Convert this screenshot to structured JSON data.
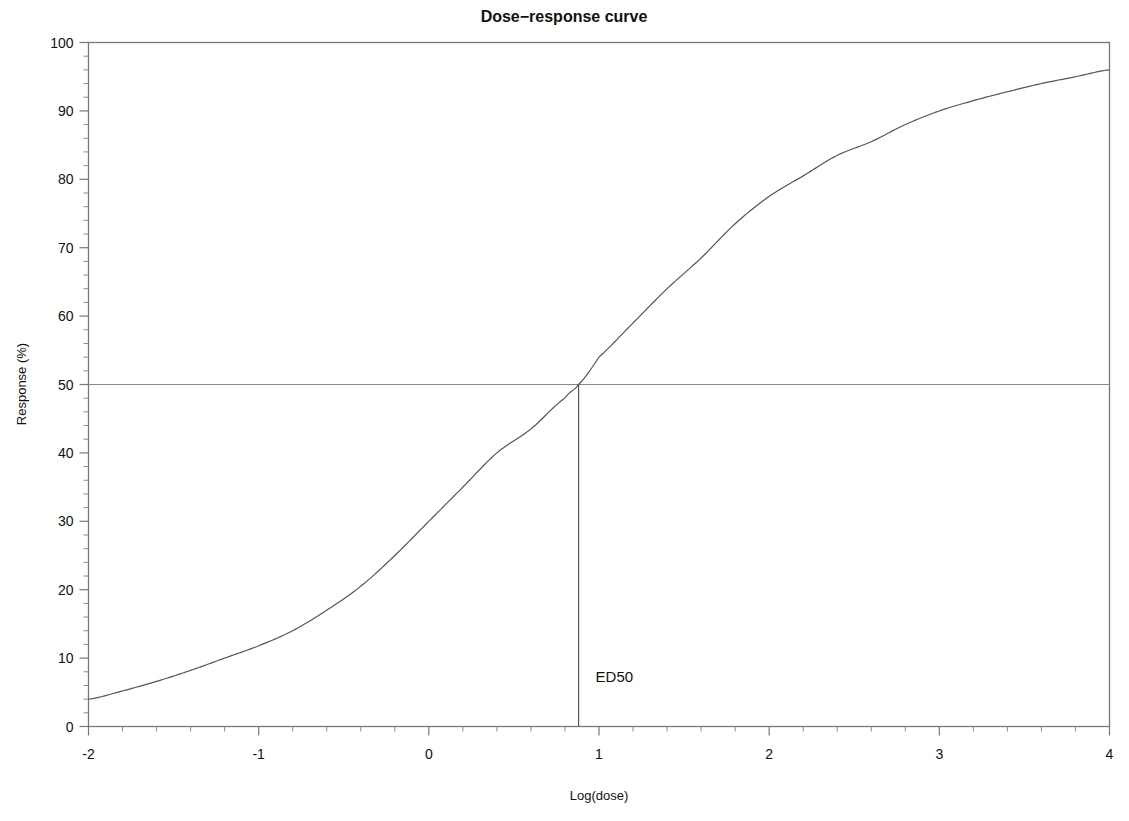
{
  "chart_data": {
    "type": "line",
    "title": "Dose−response curve",
    "xlabel": "Log(dose)",
    "ylabel": "Response (%)",
    "xlim": [
      -2,
      4
    ],
    "ylim": [
      0,
      100
    ],
    "grid": false,
    "legend": null,
    "xticks": [
      -2,
      -1,
      0,
      1,
      2,
      3,
      4
    ],
    "xticklabels": [
      "-2",
      "-1",
      "0",
      "1",
      "2",
      "3",
      "4"
    ],
    "x_minor_tick_count_per_interval": 5,
    "yticks": [
      0,
      10,
      20,
      30,
      40,
      50,
      60,
      70,
      80,
      90,
      100
    ],
    "yticklabels": [
      "0",
      "10",
      "20",
      "30",
      "40",
      "50",
      "60",
      "70",
      "80",
      "90",
      "100"
    ],
    "y_minor_tick_count_per_interval": 5,
    "series": [
      {
        "name": "dose-response",
        "color": "#555555",
        "linewidth": 1.2,
        "model": "logistic",
        "bottom": 2.0,
        "top": 100.0,
        "ed50_log": 0.88,
        "hill_slope": 0.78,
        "x": [
          -2.0,
          -1.8,
          -1.6,
          -1.4,
          -1.2,
          -1.0,
          -0.8,
          -0.6,
          -0.4,
          -0.2,
          0.0,
          0.2,
          0.4,
          0.6,
          0.8,
          0.88,
          1.0,
          1.2,
          1.4,
          1.6,
          1.8,
          2.0,
          2.2,
          2.4,
          2.6,
          2.8,
          3.0,
          3.2,
          3.4,
          3.6,
          3.8,
          4.0
        ],
        "y": [
          4.0,
          5.2,
          6.6,
          8.2,
          10.0,
          11.8,
          14.0,
          17.0,
          20.5,
          25.0,
          30.0,
          35.0,
          40.0,
          43.5,
          48.0,
          50.0,
          54.0,
          59.0,
          64.0,
          68.5,
          73.5,
          77.5,
          80.5,
          83.5,
          85.5,
          88.0,
          90.0,
          91.5,
          92.8,
          94.0,
          95.0,
          96.0
        ]
      }
    ],
    "annotations": [
      {
        "name": "ed50-marker",
        "label": "ED50",
        "x": 0.88,
        "y_from": 0,
        "y_to": 50,
        "label_x": 0.98,
        "label_y": 6.5,
        "color": "#555555"
      },
      {
        "name": "half-max-reference-line",
        "label": "",
        "y": 50,
        "x_from": -2,
        "x_to": 4,
        "color": "#888888"
      }
    ],
    "frame_color": "#777777",
    "background": "#ffffff"
  }
}
